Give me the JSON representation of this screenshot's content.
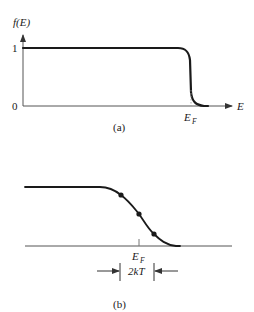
{
  "panel_a": {
    "y_axis_label": "f(E)",
    "y_ticks": [
      "1",
      "0"
    ],
    "x_axis_label": "E",
    "x_marker_label": "E",
    "x_marker_subscript": "F",
    "caption": "(a)"
  },
  "panel_b": {
    "x_marker_label": "E",
    "x_marker_subscript": "F",
    "width_label": "2kT",
    "caption": "(b)",
    "marked_points": 3
  },
  "colors": {
    "ink": "#1a1a1a",
    "axis": "#555555",
    "background": "#ffffff"
  }
}
